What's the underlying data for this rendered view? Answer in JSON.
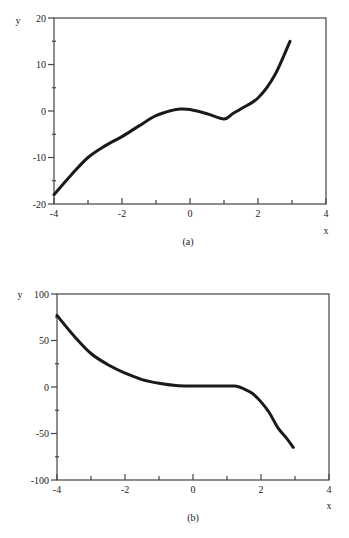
{
  "chart_data": [
    {
      "type": "line",
      "caption": "(a)",
      "title": "",
      "xlabel": "x",
      "ylabel": "y",
      "xlim": [
        -4,
        4
      ],
      "ylim": [
        -20,
        20
      ],
      "xticks": [
        -4,
        -2,
        0,
        2,
        4
      ],
      "yticks": [
        -20,
        -10,
        0,
        10,
        20
      ],
      "grid": false,
      "legend": null,
      "series": [
        {
          "name": "curve-a",
          "x": [
            -4,
            -3.5,
            -3,
            -2.5,
            -2,
            -1.5,
            -1,
            -0.5,
            -0.3,
            0,
            0.5,
            1,
            1.25,
            1.5,
            2,
            2.5,
            2.94
          ],
          "y": [
            -18,
            -13.8,
            -10,
            -7.5,
            -5.5,
            -3.2,
            -1,
            0.2,
            0.4,
            0.3,
            -0.6,
            -1.7,
            -0.6,
            0.5,
            2.8,
            7.8,
            15
          ]
        }
      ]
    },
    {
      "type": "line",
      "caption": "(b)",
      "title": "",
      "xlabel": "x",
      "ylabel": "y",
      "xlim": [
        -4,
        4
      ],
      "ylim": [
        -100,
        100
      ],
      "xticks": [
        -4,
        -2,
        0,
        2,
        4
      ],
      "yticks": [
        -100,
        -50,
        0,
        50,
        100
      ],
      "grid": false,
      "legend": null,
      "series": [
        {
          "name": "curve-b",
          "x": [
            -4,
            -3.5,
            -3,
            -2.5,
            -2,
            -1.5,
            -1,
            -0.5,
            0,
            0.5,
            1,
            1.25,
            1.5,
            1.75,
            2,
            2.25,
            2.5,
            2.75,
            2.95
          ],
          "y": [
            77,
            55,
            36,
            24,
            15,
            8,
            4,
            1.5,
            1,
            1,
            1,
            1,
            -2,
            -7,
            -16,
            -28,
            -44,
            -55,
            -65
          ]
        }
      ]
    }
  ],
  "panels": [
    {
      "frame": {
        "left": 54,
        "top": 18,
        "right": 326,
        "bottom": 204
      },
      "caption_pos": {
        "x": 188,
        "y": 245
      },
      "xlabel_pos": {
        "x": 326,
        "y": 234
      },
      "ylabel_pos": {
        "x": 18,
        "y": 24
      }
    },
    {
      "frame": {
        "left": 57,
        "top": 294,
        "right": 329,
        "bottom": 480
      },
      "caption_pos": {
        "x": 193,
        "y": 521
      },
      "xlabel_pos": {
        "x": 329,
        "y": 509
      },
      "ylabel_pos": {
        "x": 20,
        "y": 298
      }
    }
  ],
  "style": {
    "line_color": "#1a1a1a",
    "axis_color": "#444444",
    "line_width": 3
  }
}
